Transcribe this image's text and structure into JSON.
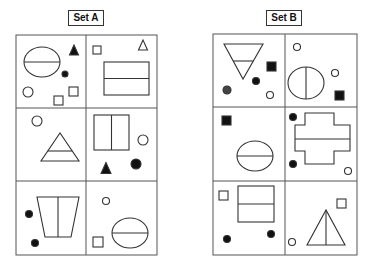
{
  "sets": [
    {
      "label": "Set A",
      "grid": {
        "x": 16,
        "y": 35,
        "w": 141,
        "h": 220,
        "colSplit": 86,
        "rowSplits": [
          108,
          181
        ]
      },
      "cells": [
        {
          "shapes": [
            {
              "type": "ellipse",
              "cx": 42,
              "cy": 62,
              "rx": 18,
              "ry": 15,
              "divider": "horizontal"
            },
            {
              "type": "triangle",
              "cx": 74,
              "cy": 50,
              "size": 10,
              "fill": "solid",
              "dir": "up"
            },
            {
              "type": "circle",
              "cx": 65,
              "cy": 74,
              "r": 3,
              "fill": "solid"
            },
            {
              "type": "circle",
              "cx": 28,
              "cy": 92,
              "r": 5,
              "fill": "outline"
            },
            {
              "type": "square",
              "x": 54,
              "y": 96,
              "s": 9,
              "fill": "outline"
            },
            {
              "type": "square",
              "x": 69,
              "y": 87,
              "s": 9,
              "fill": "outline"
            }
          ]
        },
        {
          "shapes": [
            {
              "type": "square",
              "x": 93,
              "y": 46,
              "s": 8,
              "fill": "outline"
            },
            {
              "type": "triangle",
              "cx": 143,
              "cy": 45,
              "size": 10,
              "fill": "outline",
              "dir": "up"
            },
            {
              "type": "rect",
              "x": 104,
              "y": 62,
              "w": 45,
              "h": 33,
              "divider": "horizontal"
            }
          ]
        },
        {
          "shapes": [
            {
              "type": "circle",
              "cx": 37,
              "cy": 121,
              "r": 5,
              "fill": "outline"
            },
            {
              "type": "triangle-split",
              "x1": 41,
              "y1": 161,
              "x2": 79,
              "y2": 161,
              "apex_x": 60,
              "apex_y": 133,
              "divider_y": 151
            }
          ]
        },
        {
          "shapes": [
            {
              "type": "rect",
              "x": 94,
              "y": 115,
              "w": 35,
              "h": 35,
              "divider": "vertical"
            },
            {
              "type": "circle",
              "cx": 143,
              "cy": 140,
              "r": 5,
              "fill": "outline"
            },
            {
              "type": "triangle",
              "cx": 106,
              "cy": 168,
              "size": 11,
              "fill": "solid",
              "dir": "up"
            },
            {
              "type": "circle",
              "cx": 136,
              "cy": 164,
              "r": 5,
              "fill": "solid"
            }
          ]
        },
        {
          "shapes": [
            {
              "type": "trapezoid",
              "x1": 37,
              "y1": 197,
              "x2": 79,
              "y2": 197,
              "x3": 71,
              "y3": 237,
              "x4": 45,
              "y4": 237,
              "divider": "vertical"
            },
            {
              "type": "circle",
              "cx": 29,
              "cy": 214,
              "r": 3.5,
              "fill": "solid"
            },
            {
              "type": "circle",
              "cx": 35,
              "cy": 243,
              "r": 3.5,
              "fill": "solid"
            }
          ]
        },
        {
          "shapes": [
            {
              "type": "circle",
              "cx": 106,
              "cy": 201,
              "r": 3.5,
              "fill": "outline"
            },
            {
              "type": "ellipse",
              "cx": 130,
              "cy": 233,
              "rx": 18,
              "ry": 15,
              "divider": "horizontal"
            },
            {
              "type": "square",
              "x": 93,
              "y": 237,
              "s": 10,
              "fill": "outline"
            }
          ]
        }
      ]
    },
    {
      "label": "Set B",
      "grid": {
        "x": 213,
        "y": 34,
        "w": 144,
        "h": 221,
        "colSplit": 285,
        "rowSplits": [
          107,
          181
        ]
      },
      "cells": [
        {
          "shapes": [
            {
              "type": "triangle-split",
              "x1": 224,
              "y1": 44,
              "x2": 263,
              "y2": 44,
              "apex_x": 243,
              "apex_y": 79,
              "divider_y": 61,
              "dir": "down"
            },
            {
              "type": "square",
              "x": 267,
              "y": 62,
              "s": 9,
              "fill": "solid"
            },
            {
              "type": "circle",
              "cx": 256,
              "cy": 81,
              "r": 3.5,
              "fill": "solid"
            },
            {
              "type": "circle",
              "cx": 227,
              "cy": 90,
              "r": 4,
              "fill": "dark"
            },
            {
              "type": "circle",
              "cx": 270,
              "cy": 95,
              "r": 3.5,
              "fill": "outline"
            }
          ]
        },
        {
          "shapes": [
            {
              "type": "circle",
              "cx": 297,
              "cy": 47,
              "r": 3.5,
              "fill": "outline"
            },
            {
              "type": "ellipse",
              "cx": 306,
              "cy": 83,
              "rx": 18,
              "ry": 16,
              "divider": "vertical"
            },
            {
              "type": "circle",
              "cx": 335,
              "cy": 73,
              "r": 3.5,
              "fill": "outline"
            },
            {
              "type": "square",
              "x": 335,
              "y": 91,
              "s": 9,
              "fill": "solid"
            }
          ]
        },
        {
          "shapes": [
            {
              "type": "square",
              "x": 222,
              "y": 116,
              "s": 9,
              "fill": "solid"
            },
            {
              "type": "ellipse",
              "cx": 255,
              "cy": 156,
              "rx": 18,
              "ry": 15,
              "divider": "horizontal"
            }
          ]
        },
        {
          "shapes": [
            {
              "type": "circle",
              "cx": 293,
              "cy": 117,
              "r": 3.5,
              "fill": "solid"
            },
            {
              "type": "cross",
              "divider": "horizontal"
            },
            {
              "type": "circle",
              "cx": 293,
              "cy": 164,
              "r": 3.5,
              "fill": "solid"
            },
            {
              "type": "circle",
              "cx": 348,
              "cy": 171,
              "r": 3.5,
              "fill": "outline"
            }
          ]
        },
        {
          "shapes": [
            {
              "type": "square",
              "x": 219,
              "y": 191,
              "s": 9,
              "fill": "outline"
            },
            {
              "type": "rect",
              "x": 238,
              "y": 186,
              "w": 36,
              "h": 36,
              "divider": "horizontal"
            },
            {
              "type": "circle",
              "cx": 227,
              "cy": 239,
              "r": 3.5,
              "fill": "solid"
            },
            {
              "type": "circle",
              "cx": 271,
              "cy": 234,
              "r": 3.5,
              "fill": "solid"
            }
          ]
        },
        {
          "shapes": [
            {
              "type": "square",
              "x": 337,
              "y": 199,
              "s": 9,
              "fill": "outline"
            },
            {
              "type": "triangle-split-v",
              "x1": 307,
              "y1": 245,
              "x2": 345,
              "y2": 245,
              "apex_x": 326,
              "apex_y": 210
            },
            {
              "type": "circle",
              "cx": 292,
              "cy": 242,
              "r": 3.5,
              "fill": "outline"
            }
          ]
        }
      ]
    }
  ],
  "colors": {
    "stroke": "#333333",
    "fill": "#111111",
    "fill_dark": "#444444",
    "grid": "#555555"
  }
}
